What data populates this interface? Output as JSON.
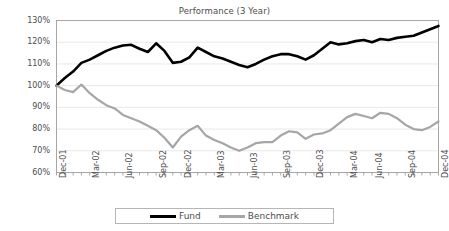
{
  "chart_data": {
    "type": "line",
    "title": "Performance (3 Year)",
    "xlabel": "",
    "ylabel": "",
    "ylim": [
      60,
      130
    ],
    "ytick_labels": [
      "130%",
      "120%",
      "110%",
      "100%",
      "90%",
      "80%",
      "70%",
      "60%"
    ],
    "ytick_values": [
      130,
      120,
      110,
      100,
      90,
      80,
      70,
      60
    ],
    "grid": true,
    "grid_axis": "y",
    "legend_position": "bottom",
    "categories": [
      "Dec-01",
      "Jan-02",
      "Feb-02",
      "Mar-02",
      "Apr-02",
      "May-02",
      "Jun-02",
      "Jul-02",
      "Aug-02",
      "Sep-02",
      "Oct-02",
      "Nov-02",
      "Dec-02",
      "Jan-03",
      "Feb-03",
      "Mar-03",
      "Apr-03",
      "May-03",
      "Jun-03",
      "Jul-03",
      "Aug-03",
      "Sep-03",
      "Oct-03",
      "Nov-03",
      "Dec-03",
      "Jan-04",
      "Feb-04",
      "Mar-04",
      "Apr-04",
      "May-04",
      "Jun-04",
      "Jul-04",
      "Aug-04",
      "Sep-04",
      "Oct-04",
      "Nov-04",
      "Dec-04"
    ],
    "xtick_labels": [
      "Dec-01",
      "Mar-02",
      "Jun-02",
      "Sep-02",
      "Dec-02",
      "Mar-03",
      "Jun-03",
      "Sep-03",
      "Dec-03",
      "Mar-04",
      "Jun-04",
      "Sep-04",
      "Dec-04"
    ],
    "xtick_indices": [
      0,
      3,
      6,
      9,
      12,
      15,
      18,
      21,
      24,
      27,
      30,
      33,
      36
    ],
    "series": [
      {
        "name": "Fund",
        "color": "#000000",
        "values": [
          100.0,
          103.5,
          106.5,
          110.5,
          112.5,
          114.5,
          116.5,
          118.5,
          118.5,
          117.0,
          115.5,
          119.5,
          116.0,
          110.5,
          111.0,
          113.5,
          117.5,
          115.5,
          113.5,
          112.0,
          110.5,
          109.0,
          108.5,
          111.5,
          113.5,
          114.5,
          114.5,
          113.5,
          112.0,
          114.0,
          117.0,
          120.0,
          119.0,
          119.5,
          120.5,
          120.5,
          120.0
        ]
      },
      {
        "name": "Benchmark",
        "color": "#a6a6a6",
        "values": [
          100.0,
          98.0,
          97.0,
          100.5,
          96.5,
          93.5,
          91.0,
          89.5,
          86.5,
          85.0,
          83.5,
          81.5,
          79.5,
          76.0,
          71.5,
          76.5,
          79.5,
          81.5,
          77.0,
          75.0,
          73.5,
          71.5,
          70.0,
          71.5,
          73.5,
          74.0,
          74.0,
          77.0,
          79.0,
          78.5,
          75.5,
          77.5,
          78.0,
          79.5,
          82.5,
          85.5,
          87.0
        ]
      }
    ],
    "series_full": {
      "fund": [
        100.0,
        103.5,
        106.5,
        110.5,
        112.0,
        114.0,
        116.0,
        117.5,
        118.5,
        118.8,
        117.0,
        115.5,
        119.5,
        116.0,
        110.5,
        111.0,
        113.0,
        117.5,
        115.5,
        113.5,
        112.5,
        111.0,
        109.5,
        108.5,
        110.0,
        112.0,
        113.5,
        114.5,
        114.5,
        113.5,
        112.0,
        114.0,
        117.0,
        120.0,
        119.0,
        119.5,
        120.5,
        121.0,
        120.0,
        121.5,
        121.0,
        122.0,
        122.5,
        123.0,
        124.5,
        126.0,
        127.5
      ],
      "benchmark": [
        100.0,
        98.0,
        97.0,
        100.5,
        96.5,
        93.5,
        91.0,
        89.5,
        86.5,
        85.0,
        83.5,
        81.5,
        79.5,
        76.0,
        71.5,
        76.5,
        79.5,
        81.5,
        77.0,
        75.0,
        73.5,
        71.5,
        70.0,
        71.5,
        73.5,
        74.0,
        74.0,
        77.0,
        79.0,
        78.5,
        75.5,
        77.5,
        78.0,
        79.5,
        82.5,
        85.5,
        87.0,
        86.0,
        85.0,
        87.5,
        87.0,
        85.0,
        82.0,
        80.0,
        79.5,
        81.0,
        83.5
      ]
    }
  },
  "legend": {
    "entries": [
      {
        "label": "Fund",
        "color": "#000000"
      },
      {
        "label": "Benchmark",
        "color": "#a6a6a6"
      }
    ]
  }
}
